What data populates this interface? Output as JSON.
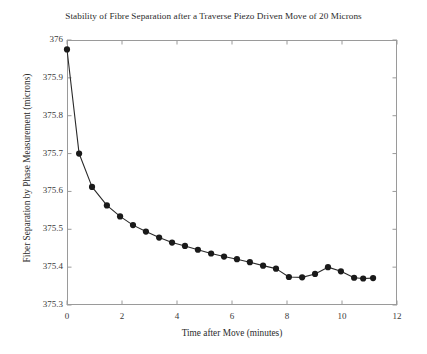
{
  "chart_data": {
    "type": "line",
    "title": "Stability of Fibre Separation after a Traverse Piezo Driven Move of 20 Microns",
    "xlabel": "Time after Move (minutes)",
    "ylabel": "Fiber Separation by Phase Measurement (microns)",
    "xlim": [
      0,
      12
    ],
    "ylim": [
      375.3,
      376
    ],
    "xticks": [
      0,
      2,
      4,
      6,
      8,
      10,
      12
    ],
    "xtick_labels": [
      "0",
      "2",
      "4",
      "6",
      "8",
      "10",
      "12"
    ],
    "yticks": [
      375.3,
      375.4,
      375.5,
      375.6,
      375.7,
      375.8,
      375.9,
      376
    ],
    "ytick_labels": [
      "375.3",
      "375.4",
      "375.5",
      "375.6",
      "375.7",
      "375.8",
      "375.9",
      "376"
    ],
    "grid": false,
    "legend": null,
    "marker": "filled-circle",
    "marker_color": "#1a1a1a",
    "line_color": "#2a2a2a",
    "x": [
      0.0,
      0.44,
      0.91,
      1.45,
      1.93,
      2.4,
      2.87,
      3.35,
      3.82,
      4.29,
      4.76,
      5.24,
      5.71,
      6.18,
      6.65,
      7.13,
      7.6,
      8.07,
      8.55,
      9.02,
      9.49,
      9.96,
      10.44,
      10.77,
      11.13
    ],
    "y": [
      375.975,
      375.7,
      375.612,
      375.563,
      375.534,
      375.511,
      375.494,
      375.478,
      375.465,
      375.456,
      375.446,
      375.436,
      375.428,
      375.421,
      375.413,
      375.404,
      375.396,
      375.374,
      375.373,
      375.382,
      375.4,
      375.389,
      375.372,
      375.37,
      375.371
    ]
  }
}
